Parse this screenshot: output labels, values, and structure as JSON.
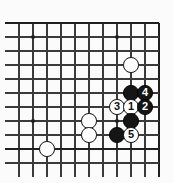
{
  "figure": {
    "kind": "go-board-diagram",
    "title": "",
    "board_color": "#fbfbfb",
    "line_color": "#3a3a3a",
    "edge_color": "#1f1f1f",
    "black_color": "#151515",
    "white_color": "#ffffff"
  },
  "board": {
    "columns": 11,
    "rows": 11,
    "cell_size": 14,
    "origin_x": 19,
    "origin_y": 23,
    "edges": {
      "top": true,
      "right": true,
      "bottom": true,
      "left": false
    },
    "star_points": [
      {
        "col": 1,
        "row": 1
      },
      {
        "col": 7,
        "row": 1
      },
      {
        "col": 1,
        "row": 7
      },
      {
        "col": 7,
        "row": 7
      }
    ]
  },
  "stones": [
    {
      "id": "white-a",
      "color": "white",
      "label": "",
      "col": 8,
      "row": 3
    },
    {
      "id": "black-a",
      "color": "black",
      "label": "",
      "col": 8,
      "row": 5
    },
    {
      "id": "move-4",
      "color": "black",
      "label": "4",
      "col": 9,
      "row": 5
    },
    {
      "id": "move-3",
      "color": "white",
      "label": "3",
      "col": 7,
      "row": 6
    },
    {
      "id": "move-1",
      "color": "white",
      "label": "1",
      "col": 8,
      "row": 6
    },
    {
      "id": "move-2",
      "color": "black",
      "label": "2",
      "col": 9,
      "row": 6
    },
    {
      "id": "white-b",
      "color": "white",
      "label": "",
      "col": 5,
      "row": 7
    },
    {
      "id": "black-b",
      "color": "black",
      "label": "",
      "col": 8,
      "row": 7
    },
    {
      "id": "white-c",
      "color": "white",
      "label": "",
      "col": 5,
      "row": 8
    },
    {
      "id": "black-c",
      "color": "black",
      "label": "",
      "col": 7,
      "row": 8
    },
    {
      "id": "move-5",
      "color": "white",
      "label": "5",
      "col": 8,
      "row": 8
    },
    {
      "id": "white-d",
      "color": "white",
      "label": "",
      "col": 2,
      "row": 9
    }
  ],
  "move_labels": [
    "1",
    "2",
    "3",
    "4",
    "5"
  ]
}
